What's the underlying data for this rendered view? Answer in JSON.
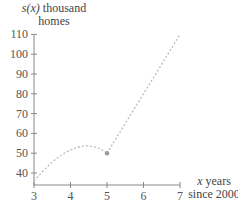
{
  "chart_data": {
    "type": "line",
    "title": "",
    "ylabel": "s(x) thousand homes",
    "xlabel": "x years since 2000",
    "xlim": [
      3,
      7
    ],
    "ylim": [
      35,
      110
    ],
    "x_ticks": [
      3,
      4,
      5,
      6,
      7
    ],
    "y_ticks": [
      40,
      50,
      60,
      70,
      80,
      90,
      100,
      110
    ],
    "grid": false,
    "legend": null,
    "series": [
      {
        "name": "curve segment (3 ≤ x ≤ 5)",
        "style": "dotted",
        "x": [
          3,
          3.5,
          4,
          4.4,
          4.75,
          5
        ],
        "values": [
          36,
          46,
          52,
          54,
          53,
          50
        ]
      },
      {
        "name": "linear segment (5 < x ≤ 7)",
        "style": "dashed",
        "x": [
          5,
          7
        ],
        "values": [
          50,
          110
        ]
      }
    ],
    "annotations": [
      {
        "type": "point",
        "x": 5,
        "y": 50
      }
    ]
  },
  "labels": {
    "y_var": "s(x)",
    "y_unit_line1": " thousand",
    "y_unit_line2": "homes",
    "x_var": "x",
    "x_unit_line1": " years",
    "x_unit_line2": "since 2000"
  },
  "ticks": {
    "x": [
      "3",
      "4",
      "5",
      "6",
      "7"
    ],
    "y": [
      "40",
      "50",
      "60",
      "70",
      "80",
      "90",
      "100",
      "110"
    ]
  },
  "colors": {
    "axis": "#888888",
    "curve": "#bbbbbb",
    "text": "#555555"
  }
}
